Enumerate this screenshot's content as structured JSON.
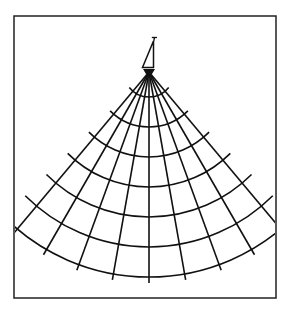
{
  "diagram": {
    "type": "fan-polar-grid",
    "frame": {
      "x": 14,
      "y": 16,
      "width": 262,
      "height": 282,
      "stroke": "#222222",
      "stroke_width": 1.5
    },
    "apex": {
      "x": 149,
      "y": 72
    },
    "radials": {
      "angles_deg": [
        -40,
        -30,
        -20,
        -10,
        0,
        10,
        20,
        30,
        40
      ],
      "length": 211,
      "stroke": "#111111",
      "stroke_width": 1.6
    },
    "arcs": {
      "radii": [
        25,
        55,
        85,
        115,
        145,
        175,
        205
      ],
      "half_span_deg": 45,
      "first_half_span_deg": 52,
      "stroke": "#111111",
      "stroke_width": 1.6
    },
    "marker": {
      "name": "transducer-marker",
      "fill": "#111111"
    }
  }
}
